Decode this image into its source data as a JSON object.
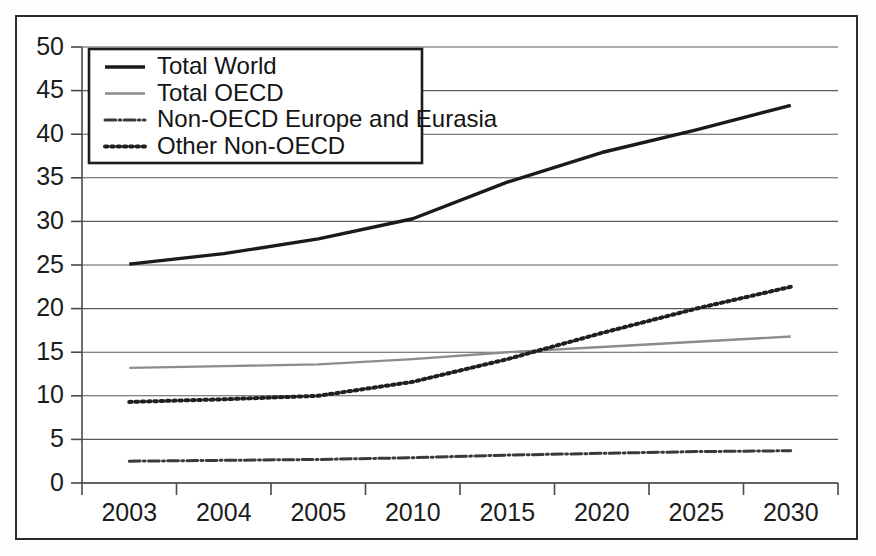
{
  "figure": {
    "frame_color": "#2b2b2b",
    "background": "#ffffff"
  },
  "chart_data": {
    "type": "line",
    "title": "",
    "subtitle": "",
    "xlabel": "",
    "ylabel": "",
    "categories": [
      "2003",
      "2004",
      "2005",
      "2010",
      "2015",
      "2020",
      "2025",
      "2030"
    ],
    "ylim": [
      0,
      50
    ],
    "yticks": [
      "0",
      "5",
      "10",
      "15",
      "20",
      "25",
      "30",
      "35",
      "40",
      "45",
      "50"
    ],
    "grid": true,
    "legend_position": "top-left",
    "series": [
      {
        "name": "Total World",
        "style": "solid",
        "color": "#1a1a1a",
        "width": 3.4,
        "values": [
          25.1,
          26.3,
          28.0,
          30.3,
          34.5,
          37.9,
          40.5,
          43.3
        ]
      },
      {
        "name": "Total OECD",
        "style": "solid",
        "color": "#8c8c8c",
        "width": 2.4,
        "values": [
          13.2,
          13.4,
          13.6,
          14.2,
          15.0,
          15.6,
          16.2,
          16.8
        ]
      },
      {
        "name": "Non-OECD Europe and Eurasia",
        "style": "dashdot",
        "color": "#3a3a3a",
        "width": 3.0,
        "values": [
          2.5,
          2.6,
          2.7,
          2.9,
          3.2,
          3.4,
          3.6,
          3.7
        ]
      },
      {
        "name": "Other Non-OECD",
        "style": "dotted",
        "color": "#1f1f1f",
        "width": 4.0,
        "values": [
          9.3,
          9.6,
          10.0,
          11.6,
          14.2,
          17.2,
          20.0,
          22.5
        ]
      }
    ]
  }
}
